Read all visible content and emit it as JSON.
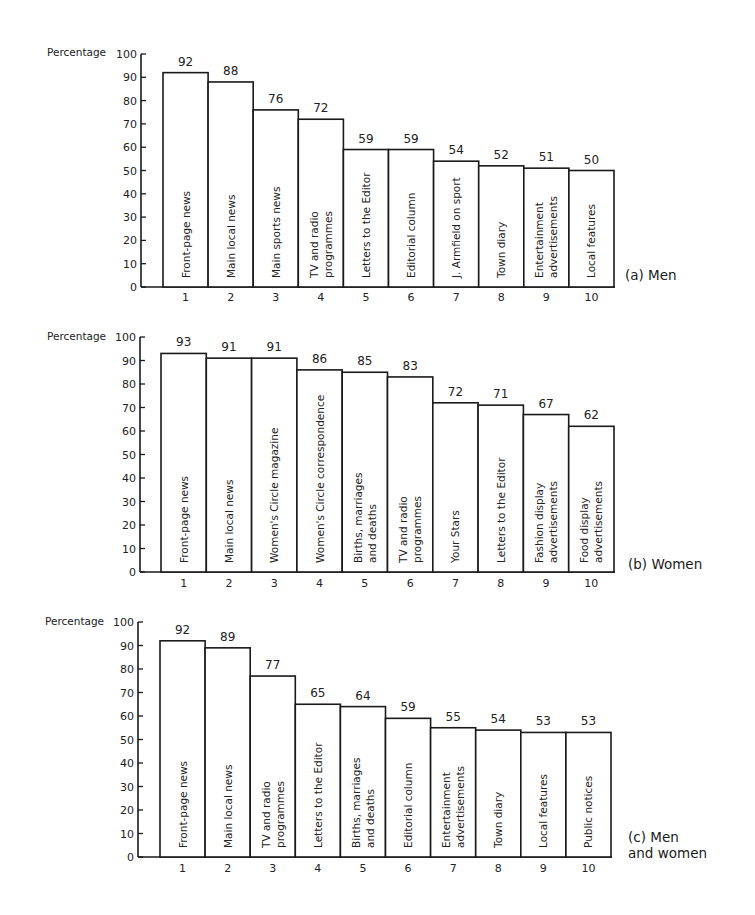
{
  "chart_data": [
    {
      "type": "bar",
      "title": "(a) Men",
      "title_lines": [
        "(a) Men"
      ],
      "ylabel": "Percentage",
      "xlabel": "",
      "ylim": [
        0,
        100
      ],
      "yticks": [
        0,
        10,
        20,
        30,
        40,
        50,
        60,
        70,
        80,
        90,
        100
      ],
      "categories": [
        "1",
        "2",
        "3",
        "4",
        "5",
        "6",
        "7",
        "8",
        "9",
        "10"
      ],
      "bar_labels": [
        [
          "Front-page news"
        ],
        [
          "Main local news"
        ],
        [
          "Main sports news"
        ],
        [
          "TV and radio",
          "programmes"
        ],
        [
          "Letters to the Editor"
        ],
        [
          "Editorial column"
        ],
        [
          "J. Armfield on sport"
        ],
        [
          "Town diary"
        ],
        [
          "Entertainment",
          "advertisements"
        ],
        [
          "Local features"
        ]
      ],
      "values": [
        92,
        88,
        76,
        72,
        59,
        59,
        54,
        52,
        51,
        50
      ],
      "grid": false
    },
    {
      "type": "bar",
      "title": "(b) Women",
      "title_lines": [
        "(b) Women"
      ],
      "ylabel": "Percentage",
      "xlabel": "",
      "ylim": [
        0,
        100
      ],
      "yticks": [
        0,
        10,
        20,
        30,
        40,
        50,
        60,
        70,
        80,
        90,
        100
      ],
      "categories": [
        "1",
        "2",
        "3",
        "4",
        "5",
        "6",
        "7",
        "8",
        "9",
        "10"
      ],
      "bar_labels": [
        [
          "Front-page news"
        ],
        [
          "Main local news"
        ],
        [
          "Women's Circle magazine"
        ],
        [
          "Women's  Circle correspondence"
        ],
        [
          "Births, marriages",
          "and deaths"
        ],
        [
          "TV and radio",
          "programmes"
        ],
        [
          "Your Stars"
        ],
        [
          "Letters to the Editor"
        ],
        [
          "Fashion display",
          "advertisements"
        ],
        [
          "Food display",
          "advertisements"
        ]
      ],
      "values": [
        93,
        91,
        91,
        86,
        85,
        83,
        72,
        71,
        67,
        62
      ],
      "grid": false
    },
    {
      "type": "bar",
      "title": "(c) Men and women",
      "title_lines": [
        "(c) Men",
        "and women"
      ],
      "ylabel": "Percentage",
      "xlabel": "",
      "ylim": [
        0,
        100
      ],
      "yticks": [
        0,
        10,
        20,
        30,
        40,
        50,
        60,
        70,
        80,
        90,
        100
      ],
      "categories": [
        "1",
        "2",
        "3",
        "4",
        "5",
        "6",
        "7",
        "8",
        "9",
        "10"
      ],
      "bar_labels": [
        [
          "Front-page news"
        ],
        [
          "Main local news"
        ],
        [
          "TV and radio",
          "programmes"
        ],
        [
          "Letters to the Editor"
        ],
        [
          "Births, marriages",
          "and deaths"
        ],
        [
          "Editorial column"
        ],
        [
          "Entertainment",
          "advertisements"
        ],
        [
          "Town diary"
        ],
        [
          "Local features"
        ],
        [
          "Public notices"
        ]
      ],
      "values": [
        92,
        89,
        77,
        65,
        64,
        59,
        55,
        54,
        53,
        53
      ],
      "grid": false
    }
  ]
}
